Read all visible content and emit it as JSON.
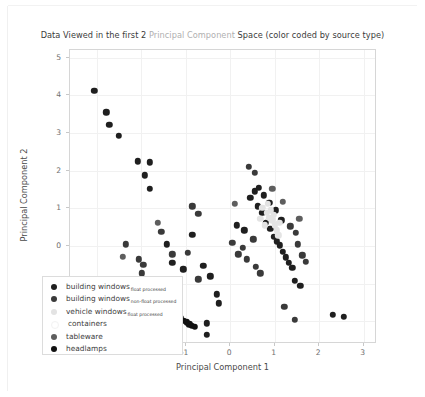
{
  "title": {
    "part1": "Data Viewed in the first 2 ",
    "part2": "Principal Component",
    "part3": " Space (color coded by source type)",
    "full": "Data Viewed in the first 2 Principal Component Space (color coded by source type)"
  },
  "axes": {
    "xlabel": "Principal Component 1",
    "ylabel": "Principal Component 2",
    "xticks": [
      "-3",
      "-2",
      "-1",
      "0",
      "1",
      "2",
      "3"
    ],
    "yticks": [
      "-2",
      "-1",
      "0",
      "1",
      "2",
      "3",
      "4",
      "5"
    ]
  },
  "legend": {
    "items": [
      {
        "label": "building windows",
        "sub": "float processed",
        "color": "#1f1f1f"
      },
      {
        "label": "building windows",
        "sub": "non-float processed",
        "color": "#3a3a3a"
      },
      {
        "label": "vehicle windows",
        "sub": "float processed",
        "color": "#e3e3e3"
      },
      {
        "label": "containers",
        "sub": "",
        "color": "#ffffff"
      },
      {
        "label": "tableware",
        "sub": "",
        "color": "#5e5e5e"
      },
      {
        "label": "headlamps",
        "sub": "",
        "color": "#111111"
      }
    ]
  },
  "colors": {
    "background": "#ffffff",
    "axis_line": "#d6d6d6",
    "grid": "#f1f1f1",
    "tick_text": "#6e6e6e",
    "label_text": "#4a4a4a",
    "title_text": "#3b3b3b",
    "title_dim": "#b0b0b0"
  },
  "chart_data": {
    "type": "scatter",
    "title": "Data Viewed in the first 2 Principal Component Space (color coded by source type)",
    "xlabel": "Principal Component 1",
    "ylabel": "Principal Component 2",
    "xlim": [
      -3.6,
      3.3
    ],
    "ylim": [
      -2.6,
      5.2
    ],
    "grid": true,
    "legend_position": "lower left",
    "series": [
      {
        "name": "building windows float processed",
        "color": "#1f1f1f",
        "points": [
          [
            -3.05,
            4.12
          ],
          [
            -2.78,
            3.55
          ],
          [
            -2.72,
            3.22
          ],
          [
            -2.5,
            2.92
          ],
          [
            -2.08,
            2.25
          ],
          [
            -1.8,
            2.22
          ],
          [
            -1.92,
            1.88
          ],
          [
            -1.8,
            1.52
          ],
          [
            -1.42,
            0.05
          ],
          [
            -1.3,
            -0.45
          ],
          [
            -1.05,
            -0.62
          ],
          [
            -0.85,
            0.3
          ],
          [
            -0.6,
            -0.52
          ],
          [
            -0.45,
            -0.8
          ],
          [
            -0.3,
            -1.28
          ],
          [
            -0.25,
            -1.52
          ],
          [
            0.15,
            0.55
          ],
          [
            0.32,
            0.42
          ],
          [
            0.45,
            1.28
          ],
          [
            0.55,
            1.45
          ],
          [
            0.62,
            1.05
          ],
          [
            0.72,
            0.88
          ],
          [
            0.8,
            0.62
          ],
          [
            0.9,
            0.45
          ],
          [
            0.98,
            0.25
          ],
          [
            1.05,
            0.12
          ],
          [
            1.12,
            0.02
          ],
          [
            1.18,
            -0.15
          ],
          [
            1.25,
            -0.3
          ],
          [
            1.32,
            -0.45
          ],
          [
            1.4,
            -0.58
          ],
          [
            1.15,
            0.68
          ],
          [
            1.02,
            0.95
          ],
          [
            0.88,
            1.15
          ],
          [
            0.75,
            1.35
          ],
          [
            0.65,
            1.55
          ],
          [
            1.45,
            -0.92
          ],
          [
            1.58,
            -1.05
          ],
          [
            2.3,
            -1.82
          ],
          [
            2.55,
            -1.88
          ],
          [
            -0.52,
            -2.05
          ],
          [
            -0.52,
            -2.35
          ]
        ]
      },
      {
        "name": "building windows non-float processed",
        "color": "#3a3a3a",
        "points": [
          [
            -2.35,
            0.05
          ],
          [
            -2.05,
            -0.35
          ],
          [
            -1.95,
            -0.5
          ],
          [
            -1.98,
            -0.72
          ],
          [
            -1.55,
            0.38
          ],
          [
            -1.3,
            -0.22
          ],
          [
            -0.95,
            -0.18
          ],
          [
            -0.72,
            -0.88
          ],
          [
            0.05,
            0.08
          ],
          [
            0.18,
            -0.22
          ],
          [
            0.28,
            -0.05
          ],
          [
            0.38,
            -0.35
          ],
          [
            0.52,
            0.18
          ],
          [
            0.58,
            -0.55
          ],
          [
            0.68,
            -0.72
          ],
          [
            0.42,
            2.1
          ],
          [
            0.55,
            1.95
          ],
          [
            1.35,
            0.52
          ],
          [
            1.48,
            0.35
          ],
          [
            1.52,
            0.05
          ],
          [
            1.62,
            -0.25
          ],
          [
            1.7,
            -0.42
          ],
          [
            1.22,
            -1.62
          ],
          [
            1.45,
            -1.95
          ],
          [
            -0.85,
            1.05
          ],
          [
            -0.72,
            0.85
          ]
        ]
      },
      {
        "name": "vehicle windows float processed",
        "color": "#e3e3e3",
        "points": [
          [
            0.72,
            1.02
          ],
          [
            0.82,
            0.88
          ],
          [
            0.88,
            0.75
          ],
          [
            0.95,
            0.68
          ],
          [
            1.0,
            0.55
          ],
          [
            1.05,
            0.42
          ],
          [
            0.92,
            0.95
          ],
          [
            0.85,
            1.12
          ],
          [
            0.78,
            0.55
          ],
          [
            0.98,
            0.82
          ],
          [
            1.1,
            0.62
          ],
          [
            1.08,
            0.28
          ],
          [
            0.68,
            0.72
          ]
        ]
      },
      {
        "name": "containers",
        "color": "#ffffff",
        "points": []
      },
      {
        "name": "tableware",
        "color": "#5e5e5e",
        "points": [
          [
            -2.42,
            -0.28
          ],
          [
            -1.62,
            0.62
          ],
          [
            0.1,
            1.12
          ],
          [
            0.95,
            1.52
          ],
          [
            1.18,
            1.18
          ],
          [
            1.55,
            0.72
          ]
        ]
      },
      {
        "name": "headlamps",
        "color": "#111111",
        "points": [
          [
            -1.72,
            -1.22
          ],
          [
            -1.55,
            -1.42
          ],
          [
            -1.48,
            -1.55
          ],
          [
            -1.4,
            -1.62
          ],
          [
            -1.32,
            -1.7
          ],
          [
            -1.25,
            -1.78
          ],
          [
            -1.18,
            -1.85
          ],
          [
            -1.12,
            -1.92
          ],
          [
            -1.05,
            -1.98
          ],
          [
            -0.98,
            -2.02
          ],
          [
            -0.92,
            -2.08
          ],
          [
            -0.86,
            -2.12
          ],
          [
            -0.8,
            -2.15
          ]
        ]
      }
    ]
  }
}
